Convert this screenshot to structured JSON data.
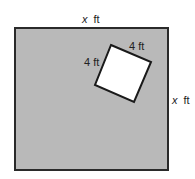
{
  "diagram": {
    "outer_square": {
      "top_label_var": "x",
      "top_label_unit": "ft",
      "right_label_var": "x",
      "right_label_unit": "ft",
      "fill": "#b9b9b9",
      "stroke": "#2a2a2a"
    },
    "inner_square": {
      "top_label": "4 ft",
      "left_label": "4 ft",
      "fill": "#ffffff",
      "stroke": "#1a1a1a"
    }
  }
}
